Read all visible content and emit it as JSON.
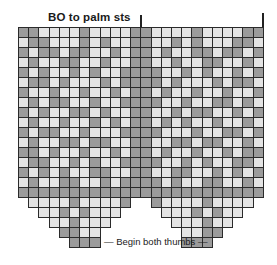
{
  "header": {
    "title": "BO to palm sts"
  },
  "footer": {
    "label": "— Begin both thumbs —"
  },
  "colors": {
    "dark": "#9b9b9b",
    "light": "#e4e4e4",
    "line": "#2a2a2a"
  },
  "grid": {
    "left": 18,
    "top": 27,
    "cell_w": 10.2,
    "cell_h": 10.0,
    "columns": 24,
    "hand_columns": 12,
    "full_rows": 17,
    "taper_rows_left": [
      [
        1,
        10
      ],
      [
        2,
        9
      ],
      [
        3,
        8
      ],
      [
        4,
        7
      ],
      [
        5,
        7
      ]
    ],
    "taper_rows_right": [
      [
        13,
        22
      ],
      [
        14,
        21
      ],
      [
        15,
        20
      ],
      [
        16,
        19
      ],
      [
        16,
        18
      ]
    ],
    "motif": [
      "DDLLLLDLLLLD",
      "LDDLLLDLDLLD",
      "DLDDLDDLLDLD",
      "LDLLDDLLDLLD",
      "DLDLLDLDLLDD",
      "LDDLDLLLDLDD",
      "DLLDLLDLLDLD",
      "LDLDDLLDLLDD",
      "DLDLLDDLDLLD",
      "LDLLDLLDLDLD",
      "DLDDLLDLLLDD",
      "LDLLDDLDDLLD",
      "DDLDLLDLLDLD",
      "LDDLLDLDLLDD",
      "DLDLDLLDDLLD",
      "LDLLDDLLDLDD",
      "DDDDDDDDDDDD",
      "DLLLLDLLLLDD",
      "DLLLDLDLLLDD",
      "DDLLLDLLLDDD",
      "DDLLDDLLDDDD",
      "DDDDDDDDDDDD"
    ]
  }
}
